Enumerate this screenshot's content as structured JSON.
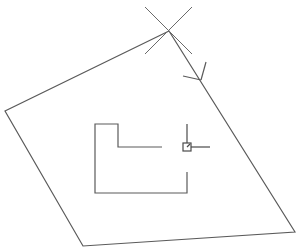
{
  "drawing": {
    "background": "#ffffff",
    "stroke_color": "#5a5a5a",
    "polygon": {
      "points": "169,31 5,111 83,246 295,232"
    },
    "crosshair_marker": {
      "line1": [
        145,
        7,
        192,
        54
      ],
      "line2": [
        192,
        7,
        145,
        54
      ]
    },
    "direction_arrow": {
      "tip": [
        201,
        80
      ],
      "barb1": [
        206,
        62
      ],
      "barb2": [
        183,
        76
      ]
    },
    "l_shape": {
      "points": "162,147 118,147 118,124 95,124 95,193 187,193 187,172"
    },
    "cursor": {
      "box": [
        183,
        143,
        8,
        8
      ],
      "inner_tick": [
        187,
        147,
        190,
        144
      ],
      "vertical_line": [
        187,
        124,
        187,
        143
      ],
      "horizontal_line": [
        191,
        147,
        210,
        147
      ]
    }
  }
}
